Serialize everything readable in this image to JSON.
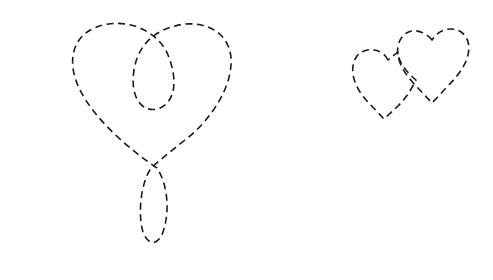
{
  "figure": {
    "background": "#ffffff",
    "stroke_color": "#1a1a1a",
    "line_style": "dashed",
    "shapes": [
      {
        "name": "looped-heart",
        "description": "Large heart outline with an inner loop at top and a teardrop loop at the bottom"
      },
      {
        "name": "small-heart-left",
        "description": "Small heart outline, left, overlapping"
      },
      {
        "name": "small-heart-right",
        "description": "Small heart outline, right, overlapping"
      }
    ]
  }
}
